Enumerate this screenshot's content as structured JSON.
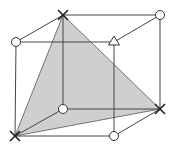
{
  "diagram": {
    "type": "cube-with-shaded-plane",
    "colors": {
      "edge": "#444444",
      "shaded_plane": "#cfcfcf",
      "background": "#ffffff"
    },
    "vertices": [
      {
        "id": "top-back-left",
        "x": 63,
        "y": 15,
        "marker": "cross"
      },
      {
        "id": "top-back-right",
        "x": 160,
        "y": 15,
        "marker": "circle"
      },
      {
        "id": "top-front-left",
        "x": 16,
        "y": 42,
        "marker": "circle"
      },
      {
        "id": "top-front-right",
        "x": 114,
        "y": 42,
        "marker": "triangle"
      },
      {
        "id": "bottom-back-left",
        "x": 63,
        "y": 109,
        "marker": "circle"
      },
      {
        "id": "bottom-back-right",
        "x": 160,
        "y": 109,
        "marker": "cross"
      },
      {
        "id": "bottom-front-left",
        "x": 15,
        "y": 136,
        "marker": "cross"
      },
      {
        "id": "bottom-front-right",
        "x": 114,
        "y": 136,
        "marker": "circle"
      }
    ],
    "shaded_plane_vertices": [
      "top-back-left",
      "bottom-back-right",
      "bottom-front-left"
    ],
    "marker_legend": {
      "cross": "X marker",
      "circle": "open circle marker",
      "triangle": "open triangle marker"
    }
  }
}
